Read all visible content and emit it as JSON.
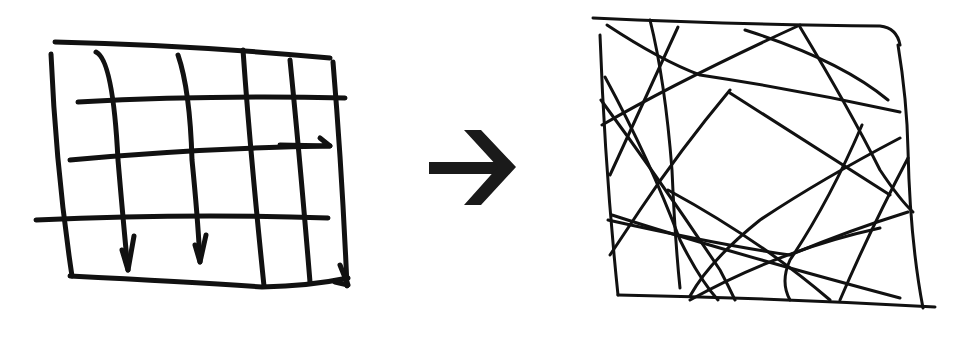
{
  "diagram": {
    "ink_color": "#111111",
    "background": "#ffffff",
    "panels": [
      {
        "id": "ordered-grid",
        "kind": "hand-drawn grid with arrowheads on some vertical lines",
        "frame": {
          "x": 50,
          "y": 40,
          "w": 300,
          "h": 245
        },
        "horizontal_lines": 3,
        "vertical_lines": 4,
        "arrowheads": 4
      },
      {
        "id": "transition-arrow",
        "kind": "right-pointing block arrow",
        "icon": "arrow-right-icon",
        "center": {
          "x": 473,
          "y": 167
        }
      },
      {
        "id": "chaotic-tangle",
        "kind": "hand-drawn frame crossed by many random lines",
        "frame": {
          "x": 595,
          "y": 18,
          "w": 340,
          "h": 290
        },
        "crossing_lines": 17
      }
    ]
  }
}
